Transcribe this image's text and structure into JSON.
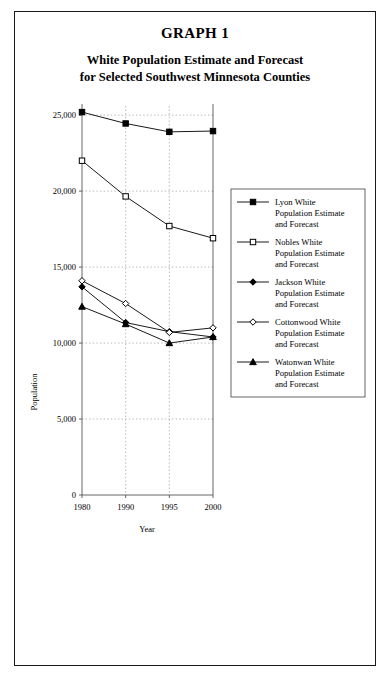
{
  "figure": {
    "number": "GRAPH 1",
    "title_lines": [
      "White Population Estimate and Forecast",
      "for Selected Southwest Minnesota Counties"
    ]
  },
  "chart_data": {
    "type": "line",
    "title": "White Population Estimate and Forecast for Selected Southwest Minnesota Counties",
    "xlabel": "Year",
    "ylabel": "Population",
    "x": [
      1980,
      1990,
      1995,
      2000
    ],
    "xtick_labels": [
      "1980",
      "1990",
      "1995",
      "2000"
    ],
    "ytick_values": [
      0,
      5000,
      10000,
      15000,
      20000,
      25000
    ],
    "ytick_labels": [
      "0",
      "5,000",
      "10,000",
      "15,000",
      "20,000",
      "25,000"
    ],
    "ylim": [
      0,
      25600
    ],
    "grid": "dotted-both",
    "legend_position": "right",
    "series": [
      {
        "name": "Lyon White Population Estimate and Forecast",
        "legend_lines": [
          "Lyon White",
          "Population Estimate",
          "and Forecast"
        ],
        "marker": "filled-square",
        "color": "#000000",
        "values": [
          25200,
          24450,
          23900,
          23950
        ]
      },
      {
        "name": "Nobles White Population Estimate and Forecast",
        "legend_lines": [
          "Nobles White",
          "Population Estimate",
          "and Forecast"
        ],
        "marker": "open-square",
        "color": "#000000",
        "values": [
          22000,
          19650,
          17700,
          16900
        ]
      },
      {
        "name": "Jackson White Population Estimate and Forecast",
        "legend_lines": [
          "Jackson White",
          "Population Estimate",
          "and Forecast"
        ],
        "marker": "filled-diamond",
        "color": "#000000",
        "values": [
          13700,
          11350,
          10750,
          10400
        ]
      },
      {
        "name": "Cottonwood White Population Estimate and Forecast",
        "legend_lines": [
          "Cottonwood White",
          "Population Estimate",
          "and Forecast"
        ],
        "marker": "open-diamond",
        "color": "#000000",
        "values": [
          14100,
          12600,
          10700,
          11000
        ]
      },
      {
        "name": "Watonwan White Population Estimate and Forecast",
        "legend_lines": [
          "Watonwan White",
          "Population Estimate",
          "and Forecast"
        ],
        "marker": "filled-triangle",
        "color": "#000000",
        "values": [
          12400,
          11250,
          10000,
          10400
        ]
      }
    ]
  }
}
